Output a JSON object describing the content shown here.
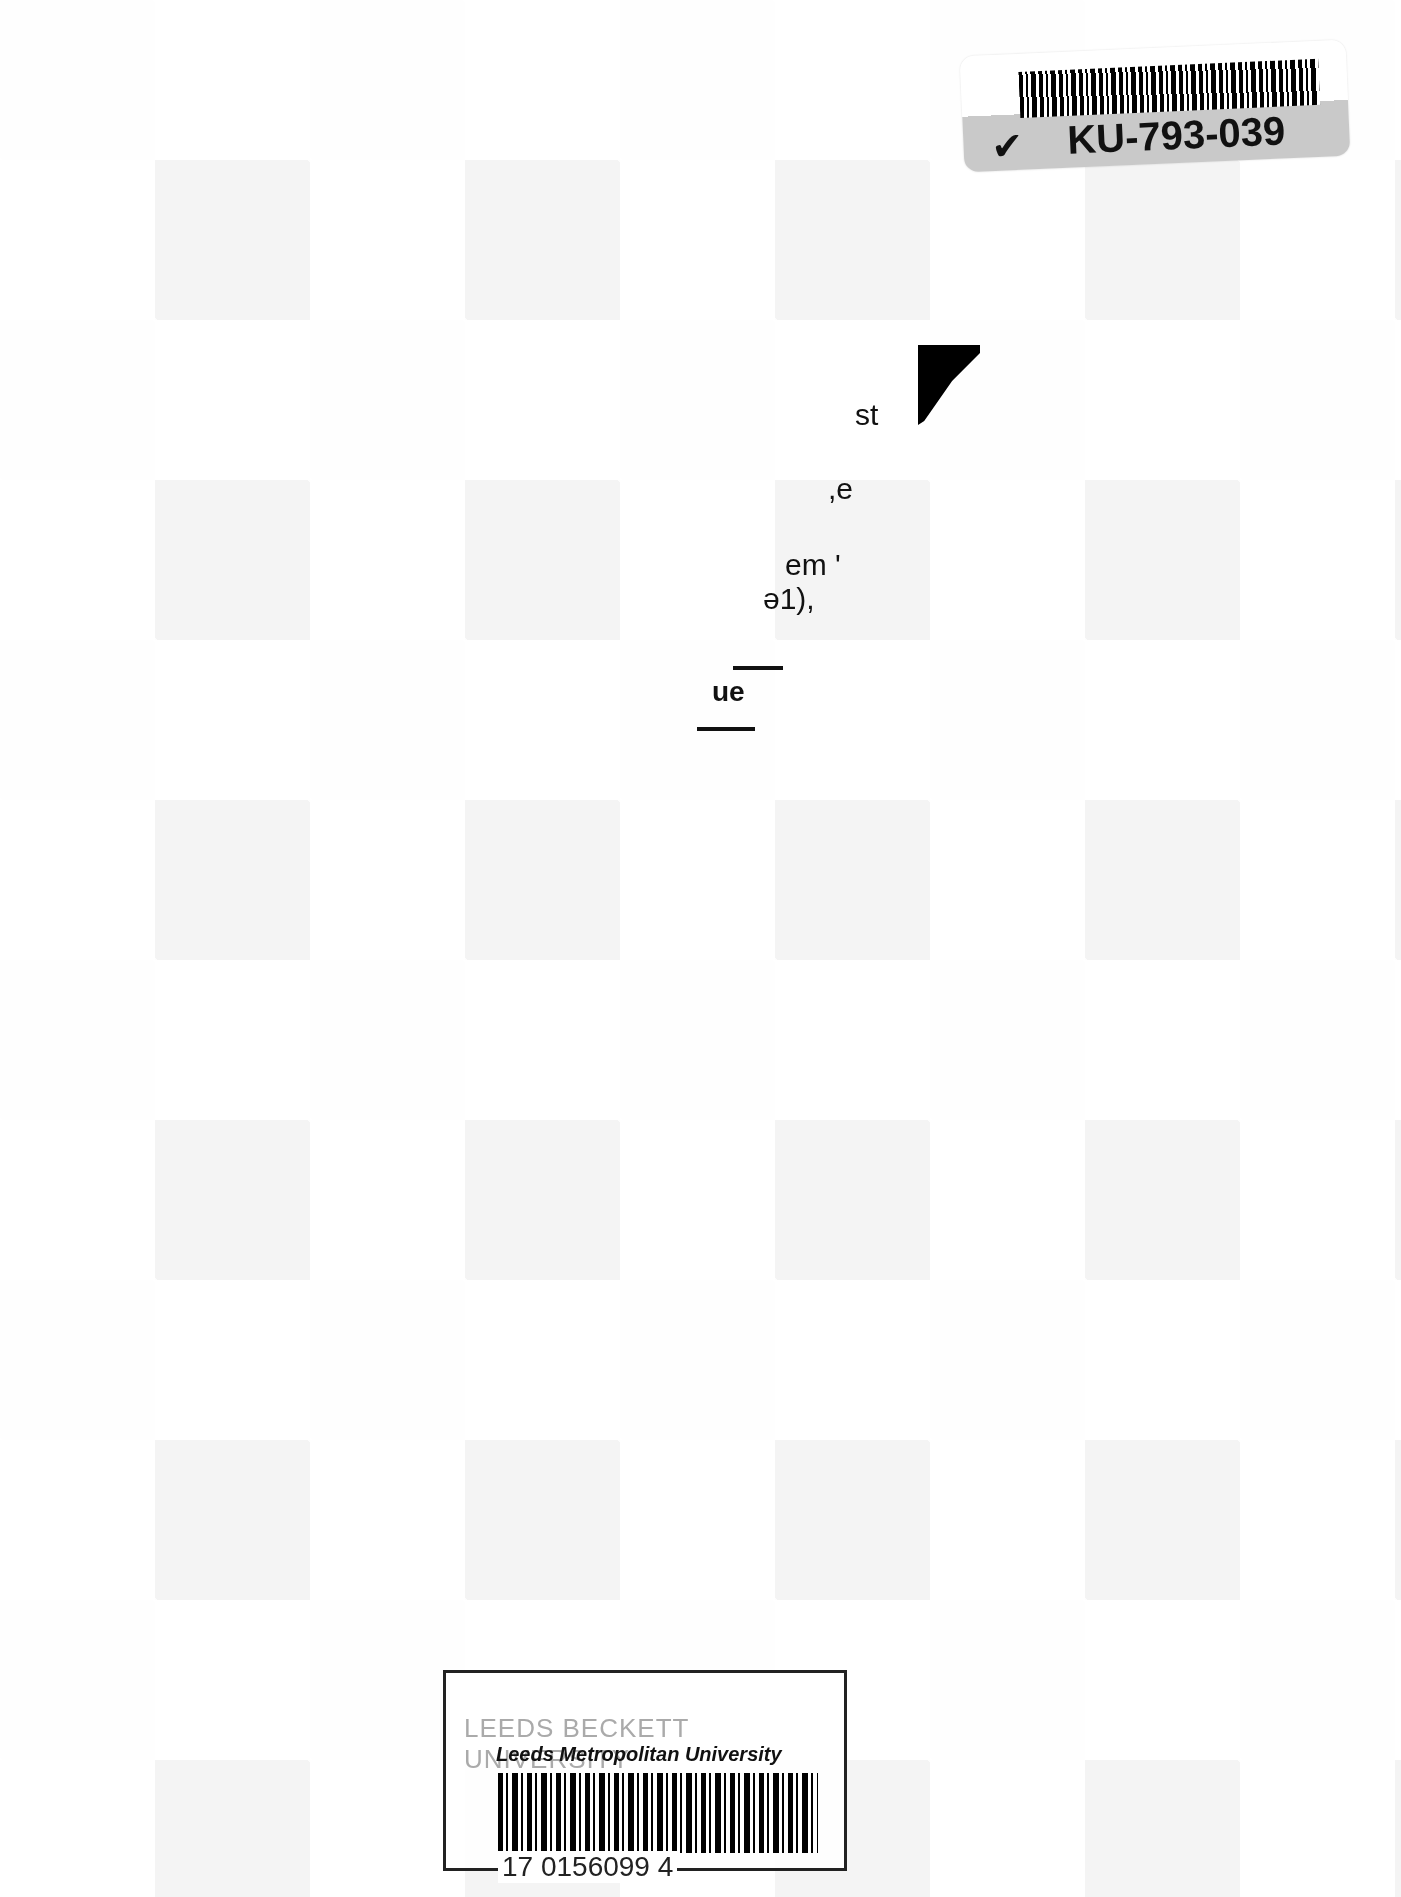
{
  "document": {
    "type": "Back cover (book)",
    "background": "light grey geometric triangle/checker pattern"
  },
  "top_label": {
    "code": "KU-793-039",
    "logo_icon": "checkmark-icon"
  },
  "text_fragments": [
    {
      "text": "st",
      "x": 855,
      "y": 400
    },
    {
      "text": ",e",
      "x": 828,
      "y": 477
    },
    {
      "text": "em '",
      "x": 785,
      "y": 553
    },
    {
      "text": "ə1),",
      "x": 763,
      "y": 585
    },
    {
      "text": "ue",
      "x": 712,
      "y": 681
    }
  ],
  "library_stamp": {
    "faint_text": "LEEDS BECKETT UNIVERSITY",
    "university": "Leeds Metropolitan University",
    "barcode_number": "17 0156099 4"
  }
}
